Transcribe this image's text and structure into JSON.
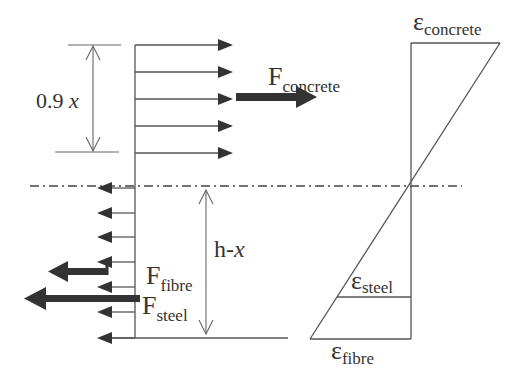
{
  "diagram": {
    "colors": {
      "line": "#555555",
      "arrow": "#333333",
      "text": "#333333",
      "background": "#ffffff"
    },
    "labels": {
      "compression_depth": {
        "main": "0.9 ",
        "italic": "x"
      },
      "tension_depth": {
        "main": "h-",
        "italic": "x"
      },
      "f_concrete": {
        "main": "F",
        "sub": "concrete"
      },
      "f_fibre": {
        "main": "F",
        "sub": "fibre"
      },
      "f_steel": {
        "main": "F",
        "sub": "steel"
      },
      "eps_concrete": {
        "main": "ε",
        "sub": "concrete"
      },
      "eps_steel": {
        "main": "ε",
        "sub": "steel"
      },
      "eps_fibre": {
        "main": "ε",
        "sub": "fibre"
      }
    },
    "stress_block": {
      "compression_arrows_count": 5,
      "tension_arrows_count": 7,
      "direction_compression": "right",
      "direction_tension": "left"
    },
    "neutral_axis": {
      "style": "dash-dot"
    }
  }
}
